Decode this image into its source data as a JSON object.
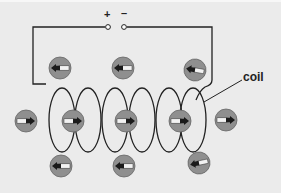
{
  "diagram": {
    "terminals": {
      "positive_label": "+",
      "negative_label": "–"
    },
    "labels": {
      "coil": "coil"
    },
    "colors": {
      "background": "#ebebeb",
      "wire": "#222222",
      "compass_face": "#8f8f8f",
      "compass_rim": "#666666",
      "needle_dark": "#1a1a1a",
      "needle_light": "#f2f2f2"
    },
    "compasses": [
      {
        "position": "top-left",
        "x": 60,
        "y": 68,
        "direction": "left"
      },
      {
        "position": "top-middle",
        "x": 123,
        "y": 68,
        "direction": "left"
      },
      {
        "position": "top-right",
        "x": 195,
        "y": 70,
        "direction": "left"
      },
      {
        "position": "outside-left",
        "x": 26,
        "y": 121,
        "direction": "right"
      },
      {
        "position": "inside-1",
        "x": 73,
        "y": 121,
        "direction": "right"
      },
      {
        "position": "inside-2",
        "x": 126,
        "y": 121,
        "direction": "right"
      },
      {
        "position": "inside-3",
        "x": 180,
        "y": 121,
        "direction": "right"
      },
      {
        "position": "outside-right",
        "x": 226,
        "y": 120,
        "direction": "right"
      },
      {
        "position": "bottom-left",
        "x": 61,
        "y": 166,
        "direction": "left"
      },
      {
        "position": "bottom-middle",
        "x": 124,
        "y": 166,
        "direction": "left"
      },
      {
        "position": "bottom-right",
        "x": 199,
        "y": 163,
        "direction": "left"
      }
    ]
  }
}
